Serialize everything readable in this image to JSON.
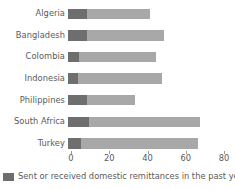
{
  "chart_data": {
    "type": "bar",
    "orientation": "horizontal",
    "stacked": true,
    "title": "",
    "xlabel": "",
    "ylabel": "",
    "xlim": [
      0,
      80
    ],
    "xticks": [
      0,
      20,
      40,
      60,
      80
    ],
    "xtick_labels": [
      "0",
      "20",
      "40",
      "60",
      "80"
    ],
    "grid": false,
    "legend_position": "bottom-left",
    "categories": [
      "Algeria",
      "Bangladesh",
      "Colombia",
      "Indonesia",
      "Philippines",
      "South Africa",
      "Turkey"
    ],
    "series": [
      {
        "name": "Sent or received domestic remittances in the past year in",
        "color": "#6e6e6e",
        "values": [
          10,
          10,
          6,
          5,
          10,
          11,
          7
        ]
      },
      {
        "name": "remainder",
        "color": "#a8a8a8",
        "values": [
          33,
          40,
          40,
          44,
          25,
          58,
          61
        ]
      }
    ],
    "totals": [
      43,
      50,
      46,
      49,
      35,
      69,
      68
    ]
  },
  "legend": {
    "lines": [
      "Sent or received domestic remittances in the past year in"
    ],
    "swatch_color": "#6e6e6e"
  },
  "colors": {
    "segment_dark": "#6e6e6e",
    "segment_light": "#a8a8a8",
    "text": "#5a5a5a",
    "axis": "#9a9a9a",
    "background": "#ffffff"
  }
}
